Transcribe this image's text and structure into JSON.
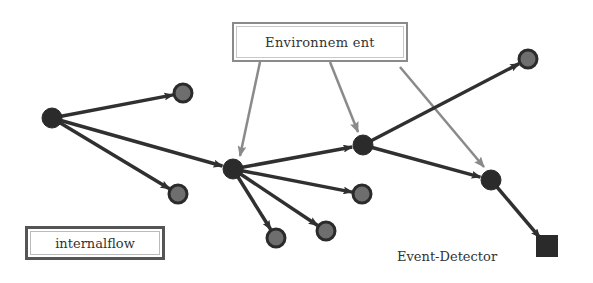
{
  "diagram": {
    "type": "directed-graph",
    "labels": {
      "environment": "Environnem ent",
      "internal_flow": "internalflow",
      "event_detector": "Event-Detector"
    },
    "colors": {
      "edge_dark": "#303030",
      "edge_env": "#8a8a8a",
      "node_dark": "#2b2b2b",
      "node_gray_fill": "#6e6e6e",
      "detector": "#2a2a2a",
      "background": "#ffffff"
    },
    "nodes": [
      {
        "id": "A",
        "x": 52,
        "y": 118,
        "kind": "dark"
      },
      {
        "id": "B",
        "x": 183,
        "y": 93,
        "kind": "gray"
      },
      {
        "id": "C",
        "x": 178,
        "y": 194,
        "kind": "gray"
      },
      {
        "id": "D",
        "x": 233,
        "y": 169,
        "kind": "dark"
      },
      {
        "id": "E",
        "x": 363,
        "y": 145,
        "kind": "dark"
      },
      {
        "id": "F",
        "x": 528,
        "y": 59,
        "kind": "gray"
      },
      {
        "id": "G",
        "x": 491,
        "y": 180,
        "kind": "dark"
      },
      {
        "id": "H",
        "x": 362,
        "y": 194,
        "kind": "gray"
      },
      {
        "id": "I",
        "x": 276,
        "y": 238,
        "kind": "gray"
      },
      {
        "id": "J",
        "x": 326,
        "y": 231,
        "kind": "gray"
      },
      {
        "id": "DET",
        "x": 547,
        "y": 246,
        "kind": "square"
      }
    ],
    "edges": [
      {
        "from": "A",
        "to": "B"
      },
      {
        "from": "A",
        "to": "C"
      },
      {
        "from": "A",
        "to": "D"
      },
      {
        "from": "D",
        "to": "E"
      },
      {
        "from": "D",
        "to": "H"
      },
      {
        "from": "D",
        "to": "I"
      },
      {
        "from": "D",
        "to": "J"
      },
      {
        "from": "E",
        "to": "F"
      },
      {
        "from": "E",
        "to": "G"
      },
      {
        "from": "G",
        "to": "DET"
      }
    ],
    "env_edges": [
      {
        "x1": 260,
        "y1": 62,
        "x2": 240,
        "y2": 156
      },
      {
        "x1": 330,
        "y1": 62,
        "x2": 358,
        "y2": 132
      },
      {
        "x1": 400,
        "y1": 67,
        "x2": 484,
        "y2": 167
      }
    ]
  }
}
